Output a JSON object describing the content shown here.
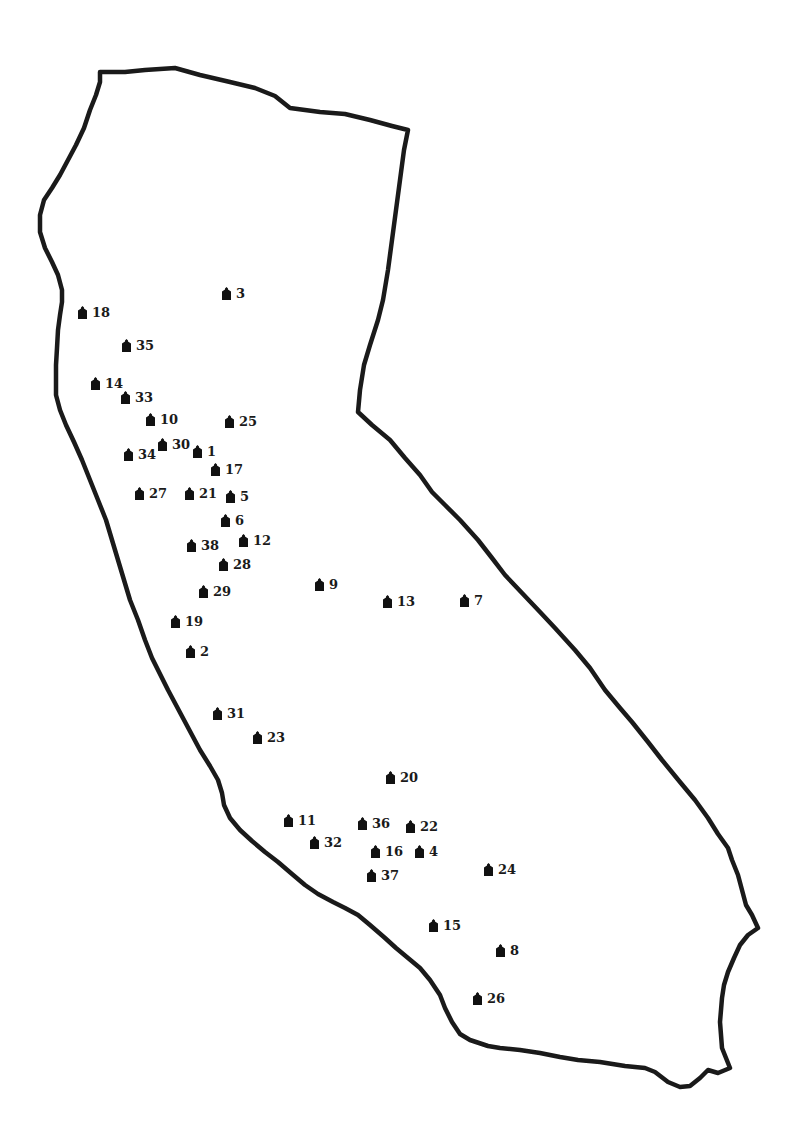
{
  "map": {
    "outline_color": "#1a1a1a",
    "marker_color": "#111111",
    "marker_icon": "house-icon",
    "sites": [
      {
        "label": "1",
        "x": 198,
        "y": 452
      },
      {
        "label": "2",
        "x": 191,
        "y": 652
      },
      {
        "label": "3",
        "x": 227,
        "y": 294
      },
      {
        "label": "4",
        "x": 420,
        "y": 852
      },
      {
        "label": "5",
        "x": 231,
        "y": 497
      },
      {
        "label": "6",
        "x": 226,
        "y": 521
      },
      {
        "label": "7",
        "x": 465,
        "y": 601
      },
      {
        "label": "8",
        "x": 501,
        "y": 951
      },
      {
        "label": "9",
        "x": 320,
        "y": 585
      },
      {
        "label": "10",
        "x": 151,
        "y": 420
      },
      {
        "label": "11",
        "x": 289,
        "y": 821
      },
      {
        "label": "12",
        "x": 244,
        "y": 541
      },
      {
        "label": "13",
        "x": 388,
        "y": 602
      },
      {
        "label": "14",
        "x": 96,
        "y": 384
      },
      {
        "label": "15",
        "x": 434,
        "y": 926
      },
      {
        "label": "16",
        "x": 376,
        "y": 852
      },
      {
        "label": "17",
        "x": 216,
        "y": 470
      },
      {
        "label": "18",
        "x": 83,
        "y": 313
      },
      {
        "label": "19",
        "x": 176,
        "y": 622
      },
      {
        "label": "20",
        "x": 391,
        "y": 778
      },
      {
        "label": "21",
        "x": 190,
        "y": 494
      },
      {
        "label": "22",
        "x": 411,
        "y": 827
      },
      {
        "label": "23",
        "x": 258,
        "y": 738
      },
      {
        "label": "24",
        "x": 489,
        "y": 870
      },
      {
        "label": "25",
        "x": 230,
        "y": 422
      },
      {
        "label": "26",
        "x": 478,
        "y": 999
      },
      {
        "label": "27",
        "x": 140,
        "y": 494
      },
      {
        "label": "28",
        "x": 224,
        "y": 565
      },
      {
        "label": "29",
        "x": 204,
        "y": 592
      },
      {
        "label": "30",
        "x": 163,
        "y": 445
      },
      {
        "label": "31",
        "x": 218,
        "y": 714
      },
      {
        "label": "32",
        "x": 315,
        "y": 843
      },
      {
        "label": "33",
        "x": 126,
        "y": 398
      },
      {
        "label": "34",
        "x": 129,
        "y": 455
      },
      {
        "label": "35",
        "x": 127,
        "y": 346
      },
      {
        "label": "36",
        "x": 363,
        "y": 824
      },
      {
        "label": "37",
        "x": 372,
        "y": 876
      },
      {
        "label": "38",
        "x": 192,
        "y": 546
      }
    ]
  }
}
